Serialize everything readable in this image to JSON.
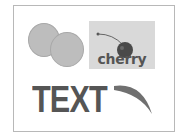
{
  "card": {
    "label": "cherry"
  },
  "headline": {
    "text": "TEXT"
  },
  "colors": {
    "circle_fill": "#bdbdbd",
    "card_bg": "#d9d9d9",
    "text": "#555555",
    "frame": "#b8b8b8"
  }
}
